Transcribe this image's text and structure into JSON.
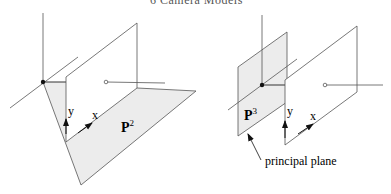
{
  "header": {
    "title": "6 Camera Models"
  },
  "figures": [
    {
      "id": "left",
      "plane_label": "P",
      "plane_exp": "2",
      "axis_x": "x",
      "axis_y": "y"
    },
    {
      "id": "right",
      "plane_label": "P",
      "plane_exp": "3",
      "axis_x": "x",
      "axis_y": "y",
      "annotation": "principal plane"
    }
  ],
  "colors": {
    "line": "#555555",
    "shade": "#ececec",
    "ink": "#111111"
  }
}
